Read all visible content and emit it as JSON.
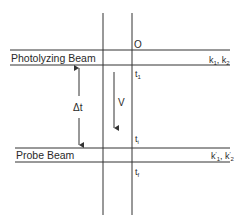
{
  "diagram": {
    "labels": {
      "photolyzing_beam": "Photolyzing Beam",
      "probe_beam": "Probe Beam",
      "origin": "O",
      "delta_t": "Δt",
      "velocity": "V",
      "t1": "t",
      "t1_sub": "1",
      "ti": "t",
      "ti_sub": "i",
      "tf": "t",
      "tf_sub": "f",
      "k_photo": "k",
      "k_photo_sub1": "1",
      "k_photo_sep": ", k",
      "k_photo_sub2": "2",
      "k_probe": "k",
      "k_probe_sub1": "1",
      "k_probe_sep": ", k",
      "k_probe_sub2": "2",
      "prime": "′"
    },
    "colors": {
      "line": "#333333",
      "text": "#2a2a2a"
    }
  }
}
